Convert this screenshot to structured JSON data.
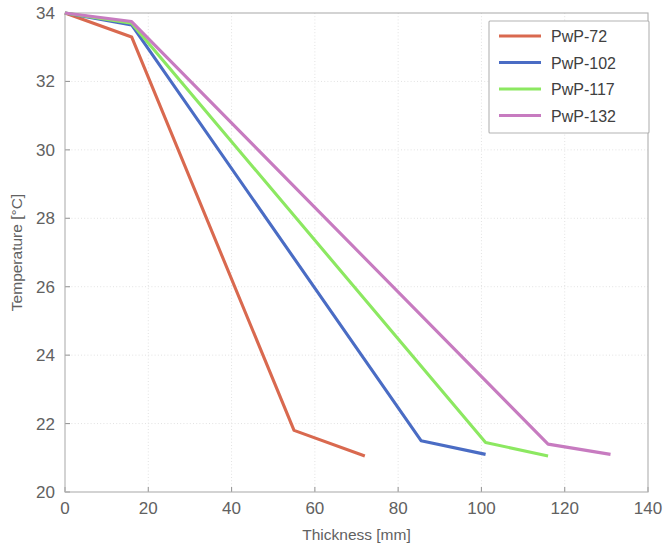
{
  "chart_data": {
    "type": "line",
    "title": "",
    "xlabel": "Thickness [mm]",
    "ylabel": "Temperature [°C]",
    "xlim": [
      0,
      140
    ],
    "ylim": [
      20,
      34
    ],
    "xticks": [
      0,
      20,
      40,
      60,
      80,
      100,
      120,
      140
    ],
    "yticks": [
      20,
      22,
      24,
      26,
      28,
      30,
      32,
      34
    ],
    "xtick_labels": [
      "0",
      "20",
      "40",
      "60",
      "80",
      "100",
      "120",
      "140"
    ],
    "ytick_labels": [
      "20",
      "22",
      "24",
      "26",
      "28",
      "30",
      "32",
      "34"
    ],
    "grid": true,
    "legend_position": "top-right",
    "series": [
      {
        "name": "PwP-72",
        "color": "#d9694f",
        "x": [
          0,
          16,
          55,
          72
        ],
        "y": [
          34.0,
          33.3,
          21.8,
          21.05
        ]
      },
      {
        "name": "PwP-102",
        "color": "#4a6cc4",
        "x": [
          0,
          16,
          85.5,
          101
        ],
        "y": [
          34.0,
          33.65,
          21.5,
          21.1
        ]
      },
      {
        "name": "PwP-117",
        "color": "#8ce861",
        "x": [
          0,
          16,
          101,
          116
        ],
        "y": [
          34.0,
          33.7,
          21.45,
          21.05
        ]
      },
      {
        "name": "PwP-132",
        "color": "#c77bc0",
        "x": [
          0,
          16,
          116,
          131
        ],
        "y": [
          34.0,
          33.75,
          21.4,
          21.1
        ]
      }
    ]
  },
  "legend": {
    "entries": [
      {
        "label": "PwP-72"
      },
      {
        "label": "PwP-102"
      },
      {
        "label": "PwP-117"
      },
      {
        "label": "PwP-132"
      }
    ]
  },
  "axes": {
    "x_axis_title": "Thickness [mm]",
    "y_axis_title": "Temperature [°C]"
  }
}
